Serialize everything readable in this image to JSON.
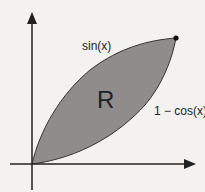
{
  "diagram": {
    "region_label": "R",
    "upper_curve_label": "sin(x)",
    "lower_curve_label": "1 − cos(x)",
    "colors": {
      "background": "#f3f2f1",
      "region_fill": "#8e8d8c",
      "lines": "#222222"
    },
    "axes": {
      "x_arrow": true,
      "y_arrow": true
    },
    "endpoint_marker": "filled-dot"
  }
}
